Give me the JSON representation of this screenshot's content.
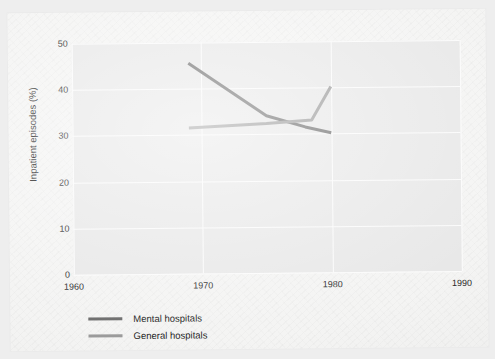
{
  "chart_data": {
    "type": "line",
    "title": "",
    "subtitle": "",
    "xlabel": "",
    "ylabel": "Inpatient episodes (%)",
    "xlim": [
      1960,
      1990
    ],
    "ylim": [
      0,
      50
    ],
    "grid": true,
    "legend_position": "below-left",
    "x_ticks": [
      "1960",
      "1970",
      "1980",
      "1990"
    ],
    "x_tick_values": [
      1960,
      1970,
      1980,
      1990
    ],
    "y_ticks": [
      "0",
      "10",
      "20",
      "30",
      "40",
      "50"
    ],
    "y_tick_values": [
      0,
      10,
      20,
      30,
      40,
      50
    ],
    "series": [
      {
        "name": "Mental hospitals",
        "color": "#6e6e6e",
        "x": [
          1969,
          1975,
          1978,
          1980
        ],
        "values": [
          45.5,
          34.0,
          31.5,
          30.2
        ]
      },
      {
        "name": "General hospitals",
        "color": "#9b9b9b",
        "x": [
          1969,
          1975,
          1978.5,
          1980
        ],
        "values": [
          31.5,
          32.3,
          33.0,
          40.2
        ]
      }
    ]
  },
  "legend": {
    "items": [
      {
        "label": "Mental hospitals",
        "swatch_color": "#6e6e6e",
        "icon": "line-swatch-icon"
      },
      {
        "label": "General hospitals",
        "swatch_color": "#9b9b9b",
        "icon": "line-swatch-icon"
      }
    ]
  },
  "colors": {
    "page": "#f4f4f3",
    "backdrop": "#eeeeee",
    "plot_background": "#e8e8e8",
    "gridline": "#fbfbfb",
    "text": "#1f1f1f"
  }
}
